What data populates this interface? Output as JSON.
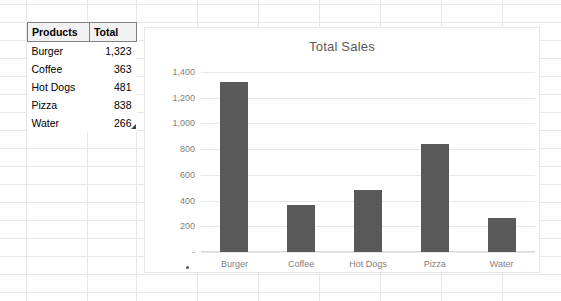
{
  "spreadsheet": {
    "table": {
      "headers": [
        "Products",
        "Total"
      ],
      "rows": [
        {
          "product": "Burger",
          "total": "1,323"
        },
        {
          "product": "Coffee",
          "total": "363"
        },
        {
          "product": "Hot Dogs",
          "total": "481"
        },
        {
          "product": "Pizza",
          "total": "838"
        },
        {
          "product": "Water",
          "total": "266"
        }
      ]
    },
    "selection_handle": "fill-handle"
  },
  "chart_data": {
    "type": "bar",
    "title": "Total Sales",
    "categories": [
      "Burger",
      "Coffee",
      "Hot Dogs",
      "Pizza",
      "Water"
    ],
    "values": [
      1323,
      363,
      481,
      838,
      266
    ],
    "series": [
      {
        "name": "Total",
        "values": [
          1323,
          363,
          481,
          838,
          266
        ]
      }
    ],
    "xlabel": "",
    "ylabel": "",
    "ylim": [
      0,
      1400
    ],
    "ytick_values": [
      0,
      200,
      400,
      600,
      800,
      1000,
      1200,
      1400
    ],
    "ytick_labels": [
      "-",
      "200",
      "400",
      "600",
      "800",
      "1,000",
      "1,200",
      "1,400"
    ],
    "grid": true,
    "legend": false,
    "bar_color": "#595959",
    "gridline_color": "#e8e8e8",
    "text_color": "#7f7f7f"
  }
}
